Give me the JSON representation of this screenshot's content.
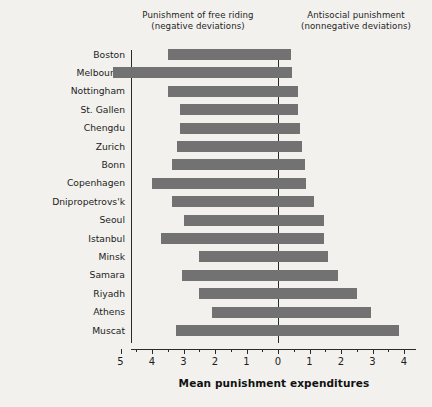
{
  "header": {
    "left_line1": "Punishment of free riding",
    "left_line2": "(negative deviations)",
    "right_line1": "Antisocial punishment",
    "right_line2": "(nonnegative deviations)"
  },
  "axis": {
    "x_title": "Mean punishment expenditures",
    "tick_labels": [
      "5",
      "4",
      "3",
      "2",
      "1",
      "0",
      "1",
      "2",
      "3",
      "4"
    ],
    "tick_values": [
      -5,
      -4,
      -3,
      -2,
      -1,
      0,
      1,
      2,
      3,
      4
    ],
    "x_min": -5.7,
    "x_max": 4.4
  },
  "style": {
    "bar_color": "#727272",
    "axis_color": "#2a2a2a",
    "background": "#f2f1ee"
  },
  "chart_data": {
    "type": "bar",
    "orientation": "horizontal",
    "title": "",
    "subtitle": "",
    "xlabel": "Mean punishment expenditures",
    "ylabel": "",
    "xlim": [
      -5.7,
      4.4
    ],
    "grid": false,
    "legend": null,
    "notes": [
      "Punishment of free riding (negative deviations)",
      "Antisocial punishment (nonnegative deviations)"
    ],
    "categories": [
      "Boston",
      "Melbourne",
      "Nottingham",
      "St. Gallen",
      "Chengdu",
      "Zurich",
      "Bonn",
      "Copenhagen",
      "Dnipropetrovs'k",
      "Seoul",
      "Istanbul",
      "Minsk",
      "Samara",
      "Riyadh",
      "Athens",
      "Muscat"
    ],
    "series": [
      {
        "name": "Punishment of free riding (negative deviations)",
        "values": [
          -3.5,
          -5.25,
          -3.5,
          -3.1,
          -3.1,
          -3.2,
          -3.35,
          -4.0,
          -3.35,
          -3.0,
          -3.7,
          -2.5,
          -3.05,
          -2.5,
          -2.1,
          -3.25
        ]
      },
      {
        "name": "Antisocial punishment (nonnegative deviations)",
        "values": [
          0.42,
          0.45,
          0.65,
          0.65,
          0.7,
          0.75,
          0.85,
          0.9,
          1.15,
          1.45,
          1.45,
          1.6,
          1.9,
          2.5,
          2.95,
          3.85
        ]
      }
    ]
  }
}
